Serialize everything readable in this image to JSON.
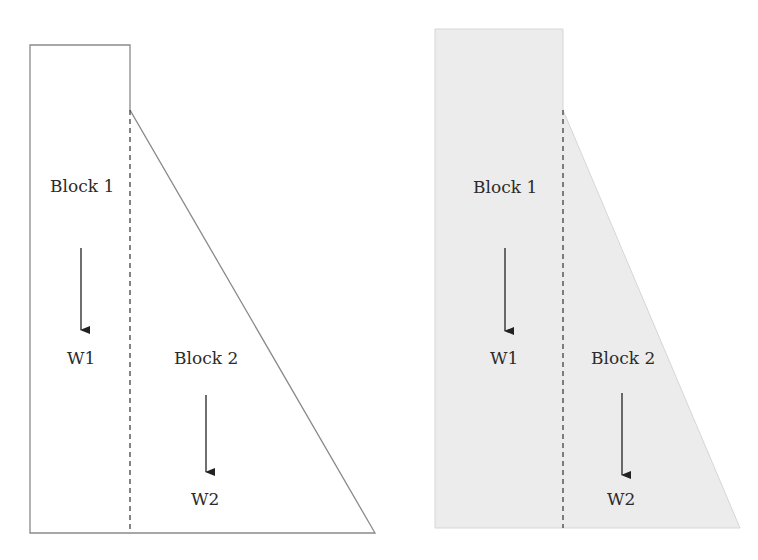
{
  "figures": [
    {
      "id": "left",
      "style": "outline",
      "block1": {
        "label": "Block 1",
        "weight_label": "W1"
      },
      "block2": {
        "label": "Block 2",
        "weight_label": "W2"
      }
    },
    {
      "id": "right",
      "style": "shaded",
      "block1": {
        "label": "Block 1",
        "weight_label": "W1"
      },
      "block2": {
        "label": "Block 2",
        "weight_label": "W2"
      }
    }
  ],
  "colors": {
    "outline": "#8a8a8a",
    "fill_shaded": "#ececec",
    "arrow": "#222222",
    "text": "#2b2b2b"
  }
}
